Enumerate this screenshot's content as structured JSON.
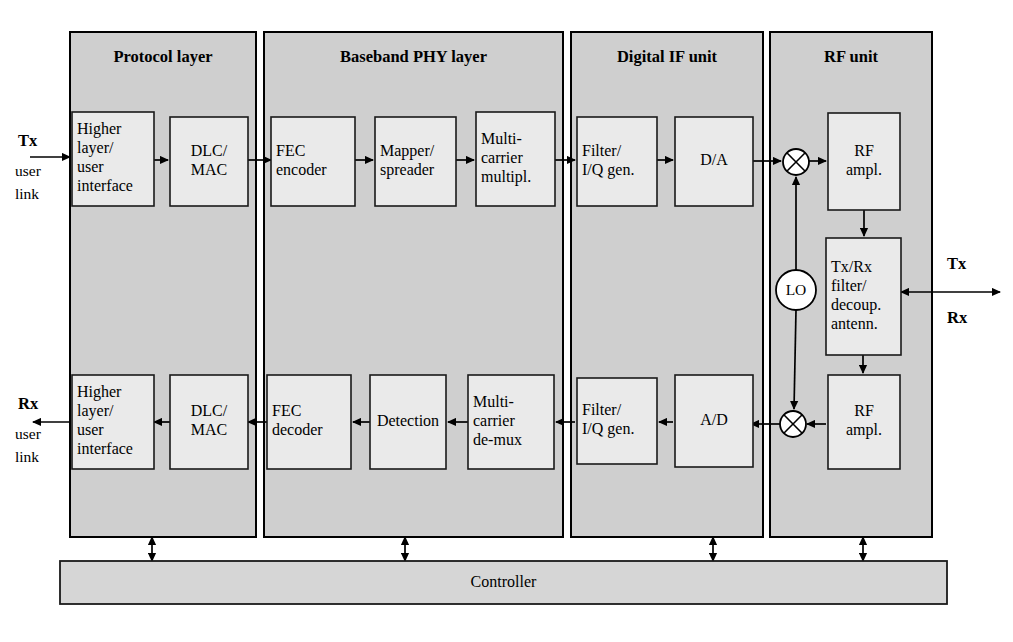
{
  "figure": {
    "type": "block-diagram",
    "background_color": "#ffffff",
    "panel_fill": "#cfcfcf",
    "block_fill": "#eaeaea",
    "bar_fill": "#d6d6d6",
    "line_color": "#000000"
  },
  "panels": [
    {
      "id": "protocol",
      "title": "Protocol layer",
      "x": 70,
      "y": 32,
      "w": 186,
      "h": 505
    },
    {
      "id": "baseband",
      "title": "Baseband PHY layer",
      "x": 264,
      "y": 32,
      "w": 299,
      "h": 505
    },
    {
      "id": "digital_if",
      "title": "Digital IF unit",
      "x": 571,
      "y": 32,
      "w": 192,
      "h": 505
    },
    {
      "id": "rf",
      "title": "RF unit",
      "x": 770,
      "y": 32,
      "w": 162,
      "h": 505
    }
  ],
  "tx_chain": [
    {
      "id": "higher-layer-user-interface-tx",
      "lines": [
        "Higher",
        "layer/",
        "user",
        "interface"
      ],
      "align": "left",
      "x": 72,
      "y": 112,
      "w": 82,
      "h": 94
    },
    {
      "id": "dlc-mac-tx",
      "lines": [
        "DLC/",
        "MAC"
      ],
      "align": "center",
      "x": 170,
      "y": 117,
      "w": 78,
      "h": 89
    },
    {
      "id": "fec-encoder",
      "lines": [
        "FEC",
        "encoder"
      ],
      "align": "left",
      "x": 271,
      "y": 117,
      "w": 84,
      "h": 89
    },
    {
      "id": "mapper-spreader",
      "lines": [
        "Mapper/",
        "spreader"
      ],
      "align": "left",
      "x": 375,
      "y": 117,
      "w": 81,
      "h": 89
    },
    {
      "id": "multi-carrier-multipl",
      "lines": [
        "Multi-",
        "carrier",
        "multipl."
      ],
      "align": "left",
      "x": 476,
      "y": 112,
      "w": 79,
      "h": 94
    },
    {
      "id": "filter-iq-gen-tx",
      "lines": [
        "Filter/",
        "I/Q gen."
      ],
      "align": "left",
      "x": 577,
      "y": 117,
      "w": 80,
      "h": 89
    },
    {
      "id": "da-converter",
      "lines": [
        "D/A"
      ],
      "align": "center",
      "x": 675,
      "y": 117,
      "w": 78,
      "h": 89
    },
    {
      "id": "rf-ampl-tx",
      "lines": [
        "RF",
        "ampl."
      ],
      "align": "center",
      "x": 828,
      "y": 113,
      "w": 72,
      "h": 97
    }
  ],
  "rx_chain": [
    {
      "id": "higher-layer-user-interface-rx",
      "lines": [
        "Higher",
        "layer/",
        "user",
        "interface"
      ],
      "align": "left",
      "x": 72,
      "y": 375,
      "w": 82,
      "h": 94
    },
    {
      "id": "dlc-mac-rx",
      "lines": [
        "DLC/",
        "MAC"
      ],
      "align": "center",
      "x": 170,
      "y": 375,
      "w": 78,
      "h": 94
    },
    {
      "id": "fec-decoder",
      "lines": [
        "FEC",
        "decoder"
      ],
      "align": "left",
      "x": 267,
      "y": 375,
      "w": 84,
      "h": 94
    },
    {
      "id": "detection",
      "lines": [
        "Detection"
      ],
      "align": "center",
      "x": 370,
      "y": 375,
      "w": 76,
      "h": 94
    },
    {
      "id": "multi-carrier-de-mux",
      "lines": [
        "Multi-",
        "carrier",
        "de-mux"
      ],
      "align": "left",
      "x": 468,
      "y": 375,
      "w": 86,
      "h": 94
    },
    {
      "id": "filter-iq-gen-rx",
      "lines": [
        "Filter/",
        "I/Q gen."
      ],
      "align": "left",
      "x": 577,
      "y": 378,
      "w": 80,
      "h": 86
    },
    {
      "id": "ad-converter",
      "lines": [
        "A/D"
      ],
      "align": "center",
      "x": 675,
      "y": 375,
      "w": 78,
      "h": 92
    },
    {
      "id": "rf-ampl-rx",
      "lines": [
        "RF",
        "ampl."
      ],
      "align": "center",
      "x": 828,
      "y": 375,
      "w": 72,
      "h": 94
    }
  ],
  "rf_blocks": [
    {
      "id": "tx-rx-filter-decoup-antenn",
      "lines": [
        "Tx/Rx",
        "filter/",
        "decoup.",
        "antenn."
      ],
      "align": "left",
      "x": 826,
      "y": 238,
      "w": 75,
      "h": 117
    }
  ],
  "nodes": {
    "mixer_tx": {
      "id": "mixer-tx",
      "cx": 796,
      "cy": 162,
      "r": 13
    },
    "mixer_rx": {
      "id": "mixer-rx",
      "cx": 793,
      "cy": 424,
      "r": 13
    },
    "lo": {
      "id": "local-oscillator",
      "label": "LO",
      "cx": 796,
      "cy": 290,
      "r": 20
    }
  },
  "io_labels": {
    "tx_in": {
      "label": "Tx",
      "sub1": "user",
      "sub2": "link",
      "x": 18,
      "y": 142
    },
    "rx_out": {
      "label": "Rx",
      "sub1": "user",
      "sub2": "link",
      "x": 18,
      "y": 405
    },
    "antenna_tx": {
      "label": "Tx",
      "x": 947,
      "y": 265
    },
    "antenna_rx": {
      "label": "Rx",
      "x": 947,
      "y": 319
    }
  },
  "controller": {
    "id": "controller-bar",
    "label": "Controller",
    "x": 60,
    "y": 561,
    "w": 887,
    "h": 43
  },
  "controller_links": [
    {
      "x": 152,
      "y1": 537,
      "y2": 561
    },
    {
      "x": 405,
      "y1": 537,
      "y2": 561
    },
    {
      "x": 713,
      "y1": 537,
      "y2": 561
    },
    {
      "x": 863,
      "y1": 537,
      "y2": 561
    }
  ]
}
